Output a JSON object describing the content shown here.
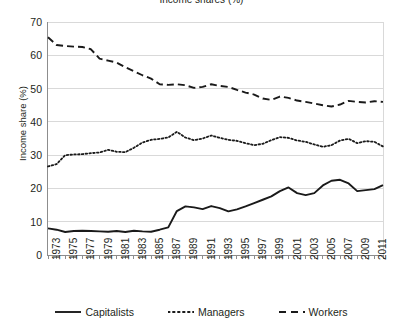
{
  "chart_data": {
    "type": "line",
    "title": "Income shares (%)",
    "xlabel": "",
    "ylabel": "Income share (%)",
    "ylim": [
      0,
      70
    ],
    "ytick_values": [
      0,
      10,
      20,
      30,
      40,
      50,
      60,
      70
    ],
    "ytick_labels": [
      "0",
      "10",
      "20",
      "30",
      "40",
      "50",
      "60",
      "70"
    ],
    "xlim": [
      1973,
      2012
    ],
    "grid": "horizontal",
    "legend_position": "bottom",
    "x": [
      1973,
      1974,
      1975,
      1976,
      1977,
      1978,
      1979,
      1980,
      1981,
      1982,
      1983,
      1984,
      1985,
      1986,
      1987,
      1988,
      1989,
      1990,
      1991,
      1992,
      1993,
      1994,
      1995,
      1996,
      1997,
      1998,
      1999,
      2000,
      2001,
      2002,
      2003,
      2004,
      2005,
      2006,
      2007,
      2008,
      2009,
      2010,
      2011,
      2012
    ],
    "xtick_labels": [
      "1973",
      "1975",
      "1977",
      "1979",
      "1981",
      "1983",
      "1985",
      "1987",
      "1989",
      "1991",
      "1993",
      "1995",
      "1997",
      "1999",
      "2001",
      "2003",
      "2005",
      "2007",
      "2009",
      "2011"
    ],
    "series": [
      {
        "name": "Capitalists",
        "style": "solid",
        "color": "#1a1a1a",
        "values": [
          8.0,
          7.6,
          6.9,
          7.2,
          7.3,
          7.2,
          7.1,
          7.0,
          7.2,
          6.9,
          7.3,
          7.1,
          7.0,
          7.6,
          8.3,
          13.2,
          14.6,
          14.3,
          13.8,
          14.7,
          14.1,
          13.1,
          13.7,
          14.6,
          15.6,
          16.6,
          17.6,
          19.2,
          20.3,
          18.6,
          18.0,
          18.6,
          20.9,
          22.3,
          22.6,
          21.5,
          19.2,
          19.5,
          19.8,
          21.0
        ]
      },
      {
        "name": "Managers",
        "style": "dotted",
        "color": "#1a1a1a",
        "values": [
          26.6,
          27.3,
          30.0,
          30.2,
          30.3,
          30.6,
          30.8,
          31.6,
          31.0,
          30.9,
          32.2,
          33.8,
          34.6,
          34.9,
          35.3,
          37.0,
          35.3,
          34.5,
          35.0,
          35.9,
          35.2,
          34.6,
          34.3,
          33.6,
          33.0,
          33.4,
          34.5,
          35.4,
          35.2,
          34.4,
          34.0,
          33.2,
          32.5,
          33.0,
          34.4,
          34.9,
          33.6,
          34.2,
          34.0,
          32.6
        ]
      },
      {
        "name": "Workers",
        "style": "dashed",
        "color": "#1a1a1a",
        "values": [
          65.4,
          63.1,
          62.8,
          62.6,
          62.5,
          61.8,
          59.0,
          58.4,
          57.8,
          56.4,
          55.2,
          54.0,
          53.0,
          51.3,
          51.1,
          51.3,
          51.0,
          50.2,
          50.5,
          51.3,
          50.8,
          50.5,
          49.6,
          48.8,
          48.2,
          47.0,
          46.6,
          47.6,
          47.2,
          46.4,
          46.0,
          45.5,
          45.0,
          44.6,
          45.2,
          46.3,
          46.0,
          45.8,
          46.2,
          46.0
        ]
      }
    ]
  },
  "legend": {
    "items": [
      {
        "label": "Capitalists",
        "style": "solid"
      },
      {
        "label": "Managers",
        "style": "dotted"
      },
      {
        "label": "Workers",
        "style": "dashed"
      }
    ]
  }
}
